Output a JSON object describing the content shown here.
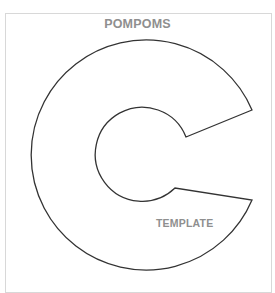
{
  "template": {
    "title": "POMPOMS",
    "label": "TEMPLATE",
    "shape": "c-shaped-pompom-ring",
    "colors": {
      "outline": "#333333",
      "text": "#8f8f8f",
      "border": "#d8d8d8",
      "background": "#ffffff"
    }
  }
}
